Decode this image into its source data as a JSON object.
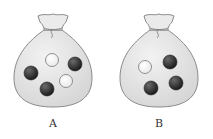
{
  "figure": {
    "bags": [
      {
        "label": "A",
        "balls": [
          {
            "color": "white",
            "cx": 52,
            "cy": 60
          },
          {
            "color": "black",
            "cx": 75,
            "cy": 64
          },
          {
            "color": "black",
            "cx": 31,
            "cy": 73
          },
          {
            "color": "white",
            "cx": 66,
            "cy": 81
          },
          {
            "color": "black",
            "cx": 47,
            "cy": 89
          }
        ],
        "white_count": 2,
        "black_count": 3
      },
      {
        "label": "B",
        "balls": [
          {
            "color": "white",
            "cx": 39,
            "cy": 67
          },
          {
            "color": "black",
            "cx": 64,
            "cy": 62
          },
          {
            "color": "black",
            "cx": 45,
            "cy": 88
          },
          {
            "color": "black",
            "cx": 70,
            "cy": 83
          }
        ],
        "white_count": 1,
        "black_count": 3
      }
    ],
    "colors": {
      "bag_fill": "#e4e4e4",
      "bag_stroke": "#8a8a8a",
      "black_ball": "#2a2a2a",
      "white_ball": "#ffffff"
    }
  }
}
